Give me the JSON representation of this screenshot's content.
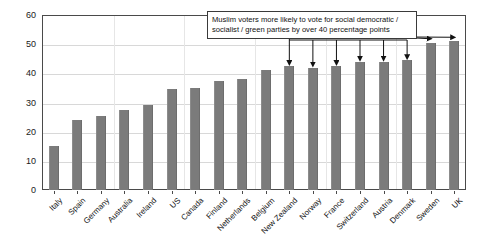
{
  "chart_data": {
    "type": "bar",
    "title": "",
    "xlabel": "",
    "ylabel": "",
    "ylim": [
      0,
      60
    ],
    "ytick_step": 10,
    "yticks": [
      0,
      10,
      20,
      30,
      40,
      50,
      60
    ],
    "grid": true,
    "legend": null,
    "bar_color": "#7b7b7b",
    "categories": [
      "Italy",
      "Spain",
      "Germany",
      "Australia",
      "Ireland",
      "US",
      "Canada",
      "Finland",
      "Netherlands",
      "Belgium",
      "New Zealand",
      "Norway",
      "France",
      "Switzerland",
      "Austria",
      "Denmark",
      "Sweden",
      "UK"
    ],
    "values": [
      15,
      24,
      25.5,
      27.5,
      29,
      34.5,
      35,
      37.5,
      38,
      41,
      42.5,
      42,
      42.5,
      44,
      44,
      44.5,
      50.5,
      51
    ],
    "annotations": [
      {
        "text": "Muslim voters more likely to vote for social democratic / socialist / green parties by over 40 percentage points",
        "points_to": [
          "New Zealand",
          "Norway",
          "France",
          "Switzerland",
          "Austria",
          "Denmark",
          "Sweden",
          "UK"
        ]
      }
    ]
  },
  "annotation": {
    "line1": "Muslim voters more likely to vote for social democratic /",
    "line2": "socialist / green parties by over 40 percentage points"
  }
}
